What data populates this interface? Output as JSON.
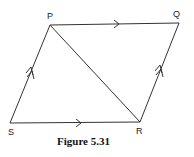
{
  "figure": {
    "caption": "Figure 5.31",
    "vertices": {
      "P": {
        "label": "P",
        "x": 50,
        "y": 25
      },
      "Q": {
        "label": "Q",
        "x": 179,
        "y": 23
      },
      "R": {
        "label": "R",
        "x": 140,
        "y": 122
      },
      "S": {
        "label": "S",
        "x": 10,
        "y": 123
      }
    },
    "edges": [
      {
        "from": "P",
        "to": "Q",
        "marker": "single-arrow"
      },
      {
        "from": "S",
        "to": "R",
        "marker": "single-arrow"
      },
      {
        "from": "S",
        "to": "P",
        "marker": "double-arrow"
      },
      {
        "from": "R",
        "to": "Q",
        "marker": "double-arrow"
      },
      {
        "from": "P",
        "to": "R",
        "marker": "none"
      }
    ],
    "line_color": "#333333"
  }
}
